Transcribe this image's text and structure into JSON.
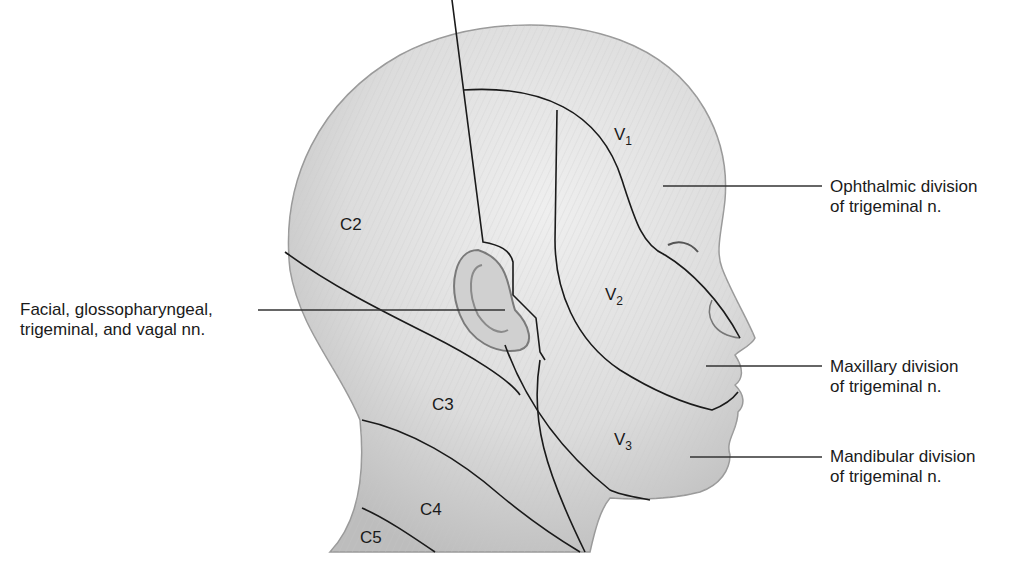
{
  "figure": {
    "regions": {
      "c2": "C2",
      "c3": "C3",
      "c4": "C4",
      "c5": "C5",
      "v1": {
        "letter": "V",
        "sub": "1"
      },
      "v2": {
        "letter": "V",
        "sub": "2"
      },
      "v3": {
        "letter": "V",
        "sub": "3"
      }
    },
    "callouts": {
      "ear": {
        "line1": "Facial, glossopharyngeal,",
        "line2": "trigeminal, and vagal nn."
      },
      "ophthalmic": {
        "line1": "Ophthalmic division",
        "line2": "of trigeminal n."
      },
      "maxillary": {
        "line1": "Maxillary division",
        "line2": "of trigeminal n."
      },
      "mandibular": {
        "line1": "Mandibular division",
        "line2": "of trigeminal n."
      }
    },
    "colors": {
      "skin_fill": "#d9d9d9",
      "outline": "#9a9a9a",
      "boundary_line": "#1a1a1a",
      "leader_line": "#333333"
    }
  }
}
